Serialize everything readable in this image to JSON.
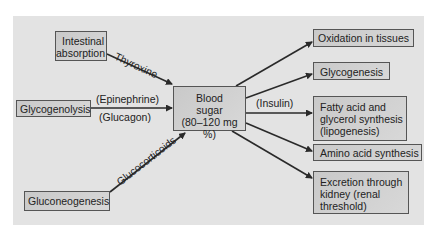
{
  "diagram": {
    "center": {
      "id": "blood_sugar",
      "lines": [
        "Blood",
        "sugar",
        "(80–120 mg %)"
      ]
    },
    "sources": [
      {
        "id": "intestinal",
        "lines": [
          "Intestinal",
          "absorption"
        ],
        "edge_label": "Thyroxine"
      },
      {
        "id": "glycogenolysis",
        "lines": [
          "Glycogenolysis"
        ],
        "edge_label_top": "(Epinephrine)",
        "edge_label_bottom": "(Glucagon)"
      },
      {
        "id": "gluconeogenesis",
        "lines": [
          "Gluconeogenesis"
        ],
        "edge_label": "Glucocorticoids"
      }
    ],
    "fates": [
      {
        "id": "oxidation",
        "lines": [
          "Oxidation in tissues"
        ]
      },
      {
        "id": "glycogenesis",
        "lines": [
          "Glycogenesis"
        ]
      },
      {
        "id": "fatty_acid",
        "lines": [
          "Fatty acid and",
          "glycerol synthesis",
          "(lipogenesis)"
        ],
        "edge_label": "(Insulin)"
      },
      {
        "id": "amino_acid",
        "lines": [
          "Amino acid synthesis"
        ]
      },
      {
        "id": "excretion",
        "lines": [
          "Excretion through",
          "kidney (renal",
          "threshold)"
        ]
      }
    ],
    "colors": {
      "panel": "#e3e3e3",
      "box": "#cfcfcf",
      "border": "#555555",
      "arrow": "#2a2a2a"
    }
  }
}
